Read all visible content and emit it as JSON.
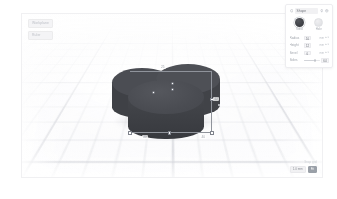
{
  "app": {
    "title": "3D Design Editor",
    "viewport_background": "#fbfbfc",
    "grid_color": "#b2b5be"
  },
  "viewport_hud": {
    "left_labels": [
      {
        "text": "Workplane"
      },
      {
        "text": "Ruler"
      }
    ],
    "bottom_right": {
      "meta": "Snap grid",
      "unit_pill": "1.0 mm",
      "view_pill": "Fit"
    }
  },
  "model": {
    "name": "Grouped Shape",
    "color": "#45474d",
    "shape": "trefoil-cylinders",
    "lobes": [
      {
        "id": "back-left",
        "top_color": "#4b4d53",
        "side_color": "#3f4146"
      },
      {
        "id": "back-right",
        "top_color": "#4e5056",
        "side_color": "#414348"
      },
      {
        "id": "front",
        "top_color": "#4a4c52",
        "side_color": "#3b3d42"
      }
    ]
  },
  "selection": {
    "active": true,
    "box_color": "#8f939b",
    "handle_fill": "#ffffff",
    "handle_stroke": "#7d818a",
    "dimensions": {
      "top": "25",
      "right": "12",
      "bottom_left": "40",
      "bottom_right": "40"
    }
  },
  "panel": {
    "title": "Shape",
    "header_icons": [
      {
        "name": "shape-icon"
      },
      {
        "name": "lightbulb-icon"
      },
      {
        "name": "help-icon"
      }
    ],
    "swatches": [
      {
        "name": "solid",
        "label": "Solid",
        "color": "#3e4045",
        "selected": true
      },
      {
        "name": "hole",
        "label": "Hole",
        "color": "#e2e3e6",
        "selected": false
      }
    ],
    "params": [
      {
        "name": "radius",
        "label": "Radius",
        "value": "10",
        "unit": "mm",
        "type": "stepper"
      },
      {
        "name": "height",
        "label": "Height",
        "value": "12",
        "unit": "mm",
        "type": "stepper"
      },
      {
        "name": "bevel",
        "label": "Bevel",
        "value": "0",
        "unit": "mm",
        "type": "stepper"
      },
      {
        "name": "segments",
        "label": "Sides",
        "value": "64",
        "unit": "",
        "type": "slider",
        "percent": 64
      }
    ]
  }
}
